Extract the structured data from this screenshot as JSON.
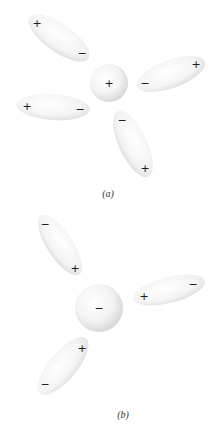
{
  "figure": {
    "panels": [
      {
        "id": "a",
        "caption": "(a)",
        "caption_pos": [
          108,
          193
        ],
        "ion": {
          "cx": 109,
          "cy": 83,
          "r": 19,
          "charge": "+"
        },
        "dipoles": [
          {
            "cx": 59,
            "cy": 38,
            "rx": 36,
            "ry": 14,
            "rot": 35,
            "pos_sign": "+",
            "pos_at": [
              37,
              23
            ],
            "neg_sign": "−",
            "neg_at": [
              82,
              53
            ]
          },
          {
            "cx": 171,
            "cy": 74,
            "rx": 36,
            "ry": 14,
            "rot": -20,
            "pos_sign": "+",
            "pos_at": [
              196,
              64
            ],
            "neg_sign": "−",
            "neg_at": [
              145,
              83
            ]
          },
          {
            "cx": 53,
            "cy": 107,
            "rx": 37,
            "ry": 13,
            "rot": 4,
            "pos_sign": "+",
            "pos_at": [
              27,
              106
            ],
            "neg_sign": "−",
            "neg_at": [
              80,
              109
            ]
          },
          {
            "cx": 133,
            "cy": 144,
            "rx": 36,
            "ry": 14,
            "rot": 65,
            "pos_sign": "+",
            "pos_at": [
              145,
              168
            ],
            "neg_sign": "−",
            "neg_at": [
              122,
              120
            ]
          }
        ]
      },
      {
        "id": "b",
        "caption": "(b)",
        "caption_pos": [
          123,
          414
        ],
        "ion": {
          "cx": 99,
          "cy": 308,
          "r": 24,
          "charge": "−"
        },
        "dipoles": [
          {
            "cx": 60,
            "cy": 245,
            "rx": 35,
            "ry": 13,
            "rot": 57,
            "pos_sign": "+",
            "pos_at": [
              75,
              268
            ],
            "neg_sign": "−",
            "neg_at": [
              45,
              224
            ]
          },
          {
            "cx": 169,
            "cy": 290,
            "rx": 37,
            "ry": 13,
            "rot": -14,
            "pos_sign": "+",
            "pos_at": [
              144,
              296
            ],
            "neg_sign": "−",
            "neg_at": [
              193,
              284
            ]
          },
          {
            "cx": 63,
            "cy": 366,
            "rx": 36,
            "ry": 14,
            "rot": -50,
            "pos_sign": "+",
            "pos_at": [
              82,
              348
            ],
            "neg_sign": "−",
            "neg_at": [
              45,
              384
            ]
          }
        ]
      }
    ]
  }
}
